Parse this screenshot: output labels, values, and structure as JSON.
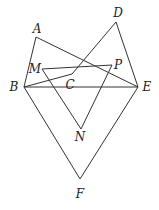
{
  "diagram": {
    "points": {
      "A": {
        "x": 36,
        "y": 37,
        "lx": 37,
        "ly": 33
      },
      "D": {
        "x": 116,
        "y": 22,
        "lx": 118,
        "ly": 17
      },
      "M": {
        "x": 42,
        "y": 69,
        "lx": 35,
        "ly": 73
      },
      "P": {
        "x": 112,
        "y": 65,
        "lx": 118,
        "ly": 69
      },
      "C": {
        "x": 72,
        "y": 74,
        "lx": 70,
        "ly": 89
      },
      "B": {
        "x": 24,
        "y": 87,
        "lx": 14,
        "ly": 91
      },
      "E": {
        "x": 138,
        "y": 87,
        "lx": 147,
        "ly": 91
      },
      "N": {
        "x": 81,
        "y": 129,
        "lx": 80,
        "ly": 141
      },
      "F": {
        "x": 80,
        "y": 179,
        "lx": 80,
        "ly": 198
      }
    },
    "segments": [
      [
        "A",
        "B"
      ],
      [
        "A",
        "E"
      ],
      [
        "D",
        "C"
      ],
      [
        "D",
        "E"
      ],
      [
        "B",
        "C"
      ],
      [
        "B",
        "E"
      ],
      [
        "M",
        "P"
      ],
      [
        "M",
        "N"
      ],
      [
        "P",
        "N"
      ],
      [
        "B",
        "F"
      ],
      [
        "E",
        "F"
      ]
    ],
    "labels": [
      "A",
      "D",
      "M",
      "P",
      "C",
      "B",
      "E",
      "N",
      "F"
    ]
  }
}
